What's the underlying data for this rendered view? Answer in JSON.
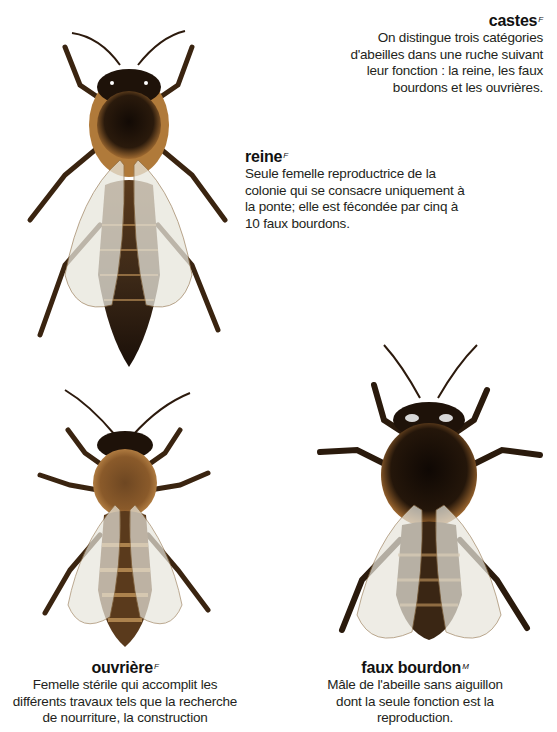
{
  "castes": {
    "term": "castes",
    "gender": "F",
    "definition_lines": [
      "On distingue trois catégories",
      "d'abeilles dans une ruche suivant",
      "leur fonction : la reine, les faux",
      "bourdons et les ouvrières."
    ]
  },
  "reine": {
    "term": "reine",
    "gender": "F",
    "definition_lines": [
      "Seule femelle reproductrice de la",
      "colonie qui se consacre uniquement à",
      "la ponte; elle est fécondée par cinq à",
      "10 faux bourdons."
    ]
  },
  "ouvriere": {
    "term": "ouvrière",
    "gender": "F",
    "definition_lines": [
      "Femelle stérile qui accomplit les",
      "différents travaux tels que la recherche",
      "de nourriture, la construction"
    ]
  },
  "faux_bourdon": {
    "term": "faux bourdon",
    "gender": "M",
    "definition_lines": [
      "Mâle de l'abeille sans aiguillon",
      "dont la seule fonction est la",
      "reproduction."
    ]
  },
  "colors": {
    "fur": "#b07a3a",
    "dark": "#1e1209",
    "wing": "#e8e6dc"
  }
}
